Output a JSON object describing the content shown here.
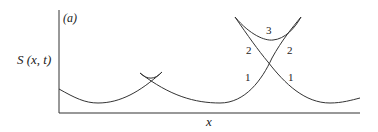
{
  "panel_label": "(a)",
  "y_axis_label": "S (x, t)",
  "x_axis_label": "x",
  "branch_labels": {
    "big_top": "3",
    "big_left_upper": "2",
    "big_right_upper": "2",
    "big_left_lower": "1",
    "big_right_lower": "1"
  },
  "colors": {
    "line": "#333333",
    "background": "#ffffff"
  }
}
